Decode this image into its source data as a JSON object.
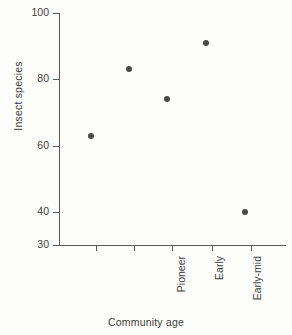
{
  "chart_data": {
    "type": "scatter",
    "title": "",
    "xlabel": "Community age",
    "ylabel": "Insect species",
    "categories": [
      "Pioneer",
      "Early",
      "Early-mid",
      "Late-mid",
      "Climax"
    ],
    "values": [
      63,
      83,
      74,
      91,
      40
    ],
    "ylim": [
      30,
      100
    ],
    "yticks": [
      30,
      40,
      60,
      80,
      100
    ],
    "ytick_labels": [
      "30",
      "40",
      "60",
      "80",
      "100"
    ],
    "grid": false,
    "legend": null,
    "marker": "filled-circle",
    "marker_color": "#4a4a4a",
    "axis_color": "#5a5a5a",
    "background_color": "#fdfdfb",
    "xtick_label_rotation": -90
  },
  "axis": {
    "y_title": "Insect species",
    "x_title": "Community age"
  },
  "ticks": {
    "y": [
      {
        "label": "100",
        "value": 100
      },
      {
        "label": "80",
        "value": 80
      },
      {
        "label": "60",
        "value": 60
      },
      {
        "label": "40",
        "value": 40
      },
      {
        "label": "30",
        "value": 30
      }
    ],
    "x": [
      {
        "label": "Pioneer",
        "value": 63
      },
      {
        "label": "Early",
        "value": 83
      },
      {
        "label": "Early-mid",
        "value": 74
      },
      {
        "label": "Late-mid",
        "value": 91
      },
      {
        "label": "Climax",
        "value": 40
      }
    ]
  }
}
